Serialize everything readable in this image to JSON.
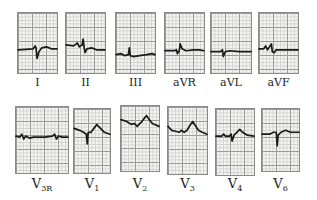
{
  "figure": {
    "top_row": [
      {
        "lead": "I",
        "label": "I",
        "x": 17,
        "y": 12,
        "w": 41,
        "h": 62,
        "trace": "M0,38 L16,37 L18,34 L19,36 L20,47 L22,40 L25,36 L30,35 L35,37 L41,37"
      },
      {
        "lead": "II",
        "label": "II",
        "x": 65,
        "y": 12,
        "w": 41,
        "h": 62,
        "trace": "M0,33 L8,34 L12,31 L14,35 L17,33 L18,27 L19,35 L20,41 L22,37 L27,36 L32,38 L41,38"
      },
      {
        "lead": "III",
        "label": "III",
        "x": 115,
        "y": 12,
        "w": 41,
        "h": 62,
        "trace": "M0,43 L5,42 L9,44 L13,43 L14,36 L15,44 L18,45 L25,44 L32,43 L38,42 L41,43"
      },
      {
        "lead": "aVR",
        "label": "aVR",
        "x": 164,
        "y": 12,
        "w": 41,
        "h": 62,
        "trace": "M0,39 L10,39 L12,38 L13,42 L15,39 L16,32 L18,37 L22,39 L30,38 L36,38 L41,39"
      },
      {
        "lead": "aVL",
        "label": "aVL",
        "x": 210,
        "y": 12,
        "w": 42,
        "h": 62,
        "trace": "M0,40 L10,40 L12,38 L13,45 L15,40 L20,39 L30,40 L42,40"
      },
      {
        "lead": "aVF",
        "label": "aVF",
        "x": 258,
        "y": 12,
        "w": 41,
        "h": 62,
        "trace": "M0,37 L5,37 L7,34 L9,38 L11,35 L13,32 L14,40 L16,41 L18,38 L24,38 L32,38 L41,38"
      }
    ],
    "bottom_row": [
      {
        "lead": "V3R",
        "label": "V",
        "sub": "3R",
        "x": 15,
        "y": 106,
        "w": 54,
        "h": 68,
        "trace": "M0,30 L4,31 L6,28 L8,33 L10,30 L14,32 L18,31 L30,31 L38,30 L40,28 L42,33 L44,30 L48,31 L54,31"
      },
      {
        "lead": "V1",
        "label": "V",
        "sub": "1",
        "x": 73,
        "y": 108,
        "w": 38,
        "h": 66,
        "trace": "M0,20 L6,22 L10,24 L13,26 L14,36 L15,24 L18,24 L21,20 L24,16 L27,19 L32,24 L38,26"
      },
      {
        "lead": "V2",
        "label": "V",
        "sub": "2",
        "x": 120,
        "y": 105,
        "w": 40,
        "h": 67,
        "trace": "M0,14 L6,16 L11,19 L14,18 L17,21 L19,19 L22,16 L25,12 L27,10 L29,13 L33,18 L40,21"
      },
      {
        "lead": "V3",
        "label": "V",
        "sub": "3",
        "x": 167,
        "y": 106,
        "w": 41,
        "h": 69,
        "trace": "M0,20 L4,24 L8,25 L12,26 L14,24 L17,26 L20,24 L23,19 L26,15 L28,18 L32,24 L36,26 L41,28"
      },
      {
        "lead": "V4",
        "label": "V",
        "sub": "4",
        "x": 215,
        "y": 108,
        "w": 40,
        "h": 68,
        "trace": "M0,28 L6,28 L8,26 L10,28 L14,28 L16,26 L17,33 L19,27 L22,24 L25,21 L28,24 L33,27 L40,28"
      },
      {
        "lead": "V6",
        "label": "V",
        "sub": "6",
        "x": 261,
        "y": 108,
        "w": 39,
        "h": 64,
        "trace": "M0,26 L8,26 L12,24 L15,24 L16,38 L17,27 L20,24 L25,22 L30,24 L39,24"
      }
    ]
  }
}
